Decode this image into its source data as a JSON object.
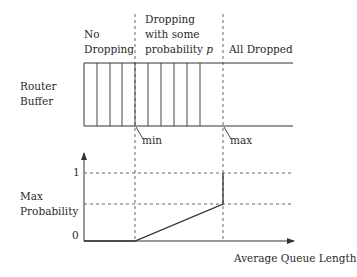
{
  "regions": {
    "no_dropping": [
      "No",
      "Dropping"
    ],
    "probabilistic": [
      "Dropping",
      "with some",
      "probability"
    ],
    "probabilistic_var": "p",
    "all_dropped": "All Dropped"
  },
  "buffer": {
    "label": [
      "Router",
      "Buffer"
    ],
    "slot_count": 9
  },
  "thresholds": {
    "min": "min",
    "max": "max"
  },
  "graph": {
    "y_label": [
      "Max",
      "Probability"
    ],
    "y_ticks": [
      "1",
      "0"
    ],
    "x_label": "Average Queue Length"
  },
  "colors": {
    "stroke": "#333333",
    "dashed": "#555555",
    "text": "#2a2a2a"
  }
}
